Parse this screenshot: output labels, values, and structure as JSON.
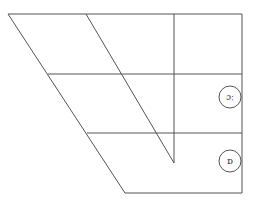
{
  "diagram": {
    "type": "ipa-vowel-chart",
    "stroke_color": "#555555",
    "background": "#ffffff",
    "vowels": [
      {
        "symbol": "ɔː",
        "position": "back open-mid",
        "cx": 230,
        "cy": 97
      },
      {
        "symbol": "ɒ",
        "position": "back open",
        "cx": 230,
        "cy": 161
      }
    ]
  }
}
